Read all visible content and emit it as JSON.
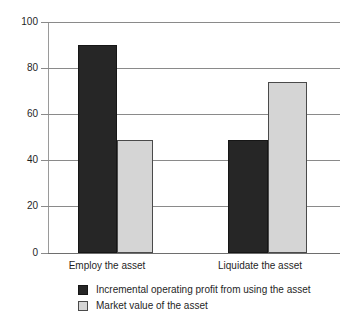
{
  "chart_data": {
    "type": "bar",
    "title": "",
    "subtitle": "",
    "xlabel": "",
    "ylabel": "",
    "ylim": [
      0,
      100
    ],
    "yticks": [
      0,
      20,
      40,
      60,
      80,
      100
    ],
    "ytick_labels": [
      "0",
      "20",
      "40",
      "60",
      "80",
      "100"
    ],
    "grid": true,
    "grid_axis": "y",
    "legend_position": "bottom-left",
    "categories": [
      "Employ the asset",
      "Liquidate the asset"
    ],
    "series": [
      {
        "name": "Incremental operating profit from using the asset",
        "color": "#262626",
        "values": [
          90,
          49
        ]
      },
      {
        "name": "Market value of the asset",
        "color": "#d5d5d5",
        "values": [
          49,
          74
        ]
      }
    ]
  },
  "axis": {
    "y_tick_labels": [
      "100",
      "80",
      "60",
      "40",
      "20",
      "0"
    ]
  },
  "categories": [
    {
      "label": "Employ the asset"
    },
    {
      "label": "Liquidate the asset"
    }
  ],
  "legend": {
    "items": [
      {
        "label": "Incremental operating profit from using the asset",
        "swatch": "dark"
      },
      {
        "label": "Market value of the asset",
        "swatch": "light"
      }
    ]
  },
  "colors": {
    "series_dark": "#262626",
    "series_light": "#d5d5d5",
    "gridline": "#8a8a8a",
    "axis": "#9a9a9a",
    "text": "#1f1f1f",
    "background": "#ffffff"
  }
}
